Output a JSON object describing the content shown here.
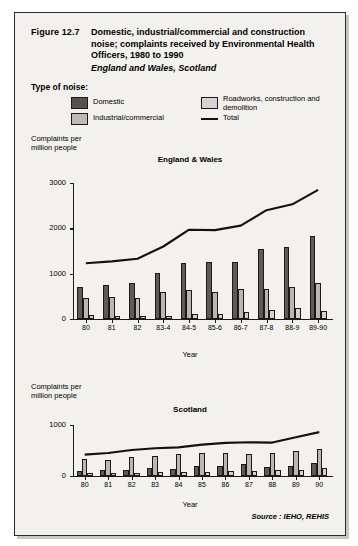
{
  "figure": {
    "number": "Figure 12.7",
    "title": "Domestic, industrial/commercial and construction noise; complaints received by Environmental Health Officers, 1980 to 1990",
    "subtitle": "England and Wales, Scotland",
    "source": "Source : IEHO, REHIS"
  },
  "legend": {
    "heading": "Type of noise:",
    "items": [
      {
        "label": "Domestic",
        "swatch": "dark-grey",
        "color": "#555351"
      },
      {
        "label": "Industrial/commercial",
        "swatch": "mid-grey",
        "color": "#bcbab6"
      },
      {
        "label": "Roadworks, construction and demolition",
        "swatch": "light-grey",
        "color": "#d6d4d0"
      },
      {
        "label": "Total",
        "swatch": "line",
        "color": "#111111"
      }
    ]
  },
  "chart_data": [
    {
      "type": "bar",
      "title": "England & Wales",
      "xlabel": "Year",
      "ylabel": "Complaints per million people",
      "ylim": [
        0,
        3000
      ],
      "yticks": [
        0,
        1000,
        2000,
        3000
      ],
      "grid": false,
      "legend_position": "top",
      "categories": [
        "80",
        "81",
        "82",
        "83-4",
        "84-5",
        "85-6",
        "86-7",
        "87-8",
        "88-9",
        "89-90"
      ],
      "series": [
        {
          "name": "Domestic",
          "type": "bar",
          "values": [
            700,
            750,
            790,
            1010,
            1230,
            1250,
            1250,
            1550,
            1590,
            1830
          ]
        },
        {
          "name": "Industrial/commercial",
          "type": "bar",
          "values": [
            470,
            480,
            470,
            600,
            650,
            595,
            655,
            670,
            700,
            790
          ]
        },
        {
          "name": "Roadworks, construction and demolition",
          "type": "bar",
          "values": [
            80,
            60,
            75,
            75,
            105,
            115,
            150,
            195,
            235,
            170
          ]
        },
        {
          "name": "Total",
          "type": "line",
          "values": [
            1230,
            1270,
            1330,
            1600,
            1970,
            1960,
            2060,
            2400,
            2530,
            2850
          ]
        }
      ]
    },
    {
      "type": "bar",
      "title": "Scotland",
      "xlabel": "Year",
      "ylabel": "Complaints per million people",
      "ylim": [
        0,
        1000
      ],
      "yticks": [
        0,
        1000
      ],
      "grid": false,
      "legend_position": "top",
      "categories": [
        "80",
        "81",
        "82",
        "83",
        "84",
        "85",
        "86",
        "87",
        "88",
        "89",
        "90"
      ],
      "series": [
        {
          "name": "Domestic",
          "type": "bar",
          "values": [
            95,
            110,
            125,
            150,
            130,
            195,
            200,
            240,
            175,
            190,
            260
          ]
        },
        {
          "name": "Industrial/commercial",
          "type": "bar",
          "values": [
            340,
            310,
            370,
            400,
            430,
            450,
            455,
            440,
            455,
            490,
            530
          ]
        },
        {
          "name": "Roadworks, construction and demolition",
          "type": "bar",
          "values": [
            50,
            50,
            60,
            70,
            75,
            70,
            100,
            95,
            110,
            120,
            150
          ]
        },
        {
          "name": "Total",
          "type": "line",
          "values": [
            420,
            450,
            510,
            545,
            560,
            615,
            650,
            660,
            655,
            760,
            860
          ]
        }
      ]
    }
  ]
}
